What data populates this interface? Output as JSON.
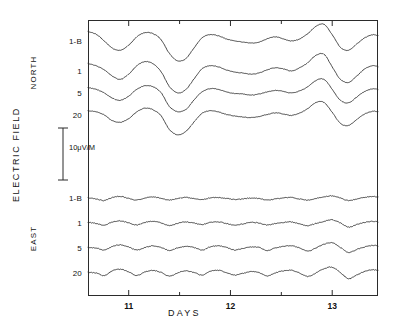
{
  "figure": {
    "background_color": "#ffffff",
    "line_color": "#2b2b2b",
    "width": 394,
    "height": 323
  },
  "axes": {
    "y_title": "ELECTRIC FIELD",
    "x_title": "DAYS",
    "x_ticks": [
      "11",
      "12",
      "13"
    ],
    "frame": {
      "left": 88,
      "top": 20,
      "width": 290,
      "height": 276
    }
  },
  "scale_bar": {
    "label": "10μV/M",
    "value": 10,
    "unit": "μV/M"
  },
  "groups": [
    {
      "name": "NORTH",
      "label": "NORTH"
    },
    {
      "name": "EAST",
      "label": "EAST"
    }
  ],
  "trace_labels": {
    "north": [
      "1-B",
      "1",
      "5",
      "20"
    ],
    "east": [
      "1-B",
      "1",
      "5",
      "20"
    ]
  },
  "chart_data": {
    "type": "line",
    "title": "",
    "subtitle": "",
    "xlabel": "DAYS",
    "ylabel": "ELECTRIC FIELD",
    "xlim": [
      10.6,
      13.45
    ],
    "x_tick_values": [
      11,
      12,
      13
    ],
    "x_minor_tick_values": [
      11.5,
      12.5
    ],
    "grid": false,
    "legend": "none",
    "y_axis_type": "stacked-offset-traces",
    "scale_bar": {
      "label": "10μV/M",
      "value": 10,
      "unit": "μV/M"
    },
    "panels": [
      {
        "name": "NORTH",
        "label": "NORTH",
        "traces": [
          {
            "name": "1-B",
            "label": "1-B",
            "baseline_y": 42,
            "x": [
              10.6,
              10.68,
              10.76,
              10.84,
              10.92,
              11.0,
              11.08,
              11.16,
              11.24,
              11.32,
              11.4,
              11.48,
              11.56,
              11.64,
              11.72,
              11.8,
              11.88,
              11.96,
              12.04,
              12.12,
              12.2,
              12.28,
              12.36,
              12.44,
              12.52,
              12.6,
              12.68,
              12.76,
              12.84,
              12.92,
              13.0,
              13.08,
              13.16,
              13.24,
              13.32,
              13.4,
              13.45
            ],
            "values": [
              2.0,
              1.5,
              0.2,
              -1.2,
              -1.6,
              -0.6,
              1.0,
              1.8,
              1.6,
              0.4,
              -2.2,
              -3.6,
              -3.2,
              -1.2,
              0.8,
              1.4,
              1.2,
              0.6,
              0.2,
              0.0,
              -0.2,
              0.0,
              0.6,
              1.0,
              0.6,
              0.2,
              0.6,
              1.6,
              3.0,
              3.4,
              1.4,
              -1.0,
              -1.6,
              -0.4,
              0.8,
              1.4,
              1.2
            ]
          },
          {
            "name": "1",
            "label": "1",
            "baseline_y": 72,
            "x": [
              10.6,
              10.68,
              10.76,
              10.84,
              10.92,
              11.0,
              11.08,
              11.16,
              11.24,
              11.32,
              11.4,
              11.48,
              11.56,
              11.64,
              11.72,
              11.8,
              11.88,
              11.96,
              12.04,
              12.12,
              12.2,
              12.28,
              12.36,
              12.44,
              12.52,
              12.6,
              12.68,
              12.76,
              12.84,
              12.92,
              13.0,
              13.08,
              13.16,
              13.24,
              13.32,
              13.4,
              13.45
            ],
            "values": [
              1.6,
              1.2,
              0.4,
              -0.8,
              -1.4,
              -0.4,
              1.2,
              2.0,
              1.6,
              0.0,
              -2.8,
              -4.0,
              -3.4,
              -1.4,
              0.6,
              1.2,
              1.0,
              0.4,
              0.0,
              -0.2,
              -0.4,
              -0.2,
              0.4,
              0.8,
              0.6,
              0.2,
              0.8,
              1.8,
              3.2,
              3.4,
              1.0,
              -1.4,
              -2.0,
              -0.8,
              0.6,
              1.2,
              1.0
            ]
          },
          {
            "name": "5",
            "label": "5",
            "baseline_y": 94,
            "x": [
              10.6,
              10.68,
              10.76,
              10.84,
              10.92,
              11.0,
              11.08,
              11.16,
              11.24,
              11.32,
              11.4,
              11.48,
              11.56,
              11.64,
              11.72,
              11.8,
              11.88,
              11.96,
              12.04,
              12.12,
              12.2,
              12.28,
              12.36,
              12.44,
              12.52,
              12.6,
              12.68,
              12.76,
              12.84,
              12.92,
              13.0,
              13.08,
              13.16,
              13.24,
              13.32,
              13.4,
              13.45
            ],
            "values": [
              1.2,
              0.9,
              0.2,
              -0.8,
              -1.2,
              -0.4,
              0.9,
              1.6,
              1.4,
              0.2,
              -2.4,
              -3.4,
              -3.0,
              -1.2,
              0.4,
              1.0,
              0.9,
              0.4,
              0.1,
              0.0,
              -0.2,
              0.0,
              0.4,
              0.7,
              0.5,
              0.2,
              0.6,
              1.4,
              2.6,
              2.8,
              0.9,
              -1.2,
              -1.7,
              -0.6,
              0.5,
              1.0,
              0.9
            ]
          },
          {
            "name": "20",
            "label": "20",
            "baseline_y": 116,
            "x": [
              10.6,
              10.68,
              10.76,
              10.84,
              10.92,
              11.0,
              11.08,
              11.16,
              11.24,
              11.32,
              11.4,
              11.48,
              11.56,
              11.64,
              11.72,
              11.8,
              11.88,
              11.96,
              12.04,
              12.12,
              12.2,
              12.28,
              12.36,
              12.44,
              12.52,
              12.6,
              12.68,
              12.76,
              12.84,
              12.92,
              13.0,
              13.08,
              13.16,
              13.24,
              13.32,
              13.4,
              13.45
            ],
            "values": [
              1.0,
              0.8,
              0.2,
              -0.9,
              -1.2,
              -0.5,
              0.8,
              1.5,
              1.2,
              0.0,
              -2.6,
              -3.6,
              -3.0,
              -1.2,
              0.5,
              1.0,
              0.8,
              0.3,
              0.0,
              -0.2,
              -0.3,
              -0.1,
              0.3,
              0.6,
              0.4,
              0.1,
              0.6,
              1.4,
              2.6,
              2.6,
              0.7,
              -1.4,
              -1.8,
              -0.7,
              0.4,
              0.9,
              0.8
            ]
          }
        ]
      },
      {
        "name": "EAST",
        "label": "EAST",
        "traces": [
          {
            "name": "1-B",
            "label": "1-B",
            "baseline_y": 199,
            "x": [
              10.6,
              10.68,
              10.76,
              10.84,
              10.92,
              11.0,
              11.08,
              11.16,
              11.24,
              11.32,
              11.4,
              11.48,
              11.56,
              11.64,
              11.72,
              11.8,
              11.88,
              11.96,
              12.04,
              12.12,
              12.2,
              12.28,
              12.36,
              12.44,
              12.52,
              12.6,
              12.68,
              12.76,
              12.84,
              12.92,
              13.0,
              13.08,
              13.16,
              13.24,
              13.32,
              13.4,
              13.45
            ],
            "values": [
              0.2,
              0.0,
              -0.3,
              0.3,
              0.5,
              0.1,
              -0.2,
              0.2,
              0.4,
              0.1,
              -0.2,
              0.1,
              0.3,
              0.1,
              -0.1,
              0.2,
              0.3,
              0.1,
              -0.1,
              0.0,
              0.2,
              0.1,
              -0.2,
              0.0,
              0.2,
              0.3,
              0.0,
              -0.2,
              0.1,
              0.4,
              0.6,
              0.2,
              -0.3,
              0.0,
              0.3,
              0.5,
              0.4
            ]
          },
          {
            "name": "1",
            "label": "1",
            "baseline_y": 224,
            "x": [
              10.6,
              10.68,
              10.76,
              10.84,
              10.92,
              11.0,
              11.08,
              11.16,
              11.24,
              11.32,
              11.4,
              11.48,
              11.56,
              11.64,
              11.72,
              11.8,
              11.88,
              11.96,
              12.04,
              12.12,
              12.2,
              12.28,
              12.36,
              12.44,
              12.52,
              12.6,
              12.68,
              12.76,
              12.84,
              12.92,
              13.0,
              13.08,
              13.16,
              13.24,
              13.32,
              13.4,
              13.45
            ],
            "values": [
              0.3,
              0.1,
              -0.2,
              0.4,
              0.6,
              0.2,
              -0.2,
              0.3,
              0.5,
              0.2,
              -0.3,
              0.1,
              0.4,
              0.2,
              -0.1,
              0.3,
              0.4,
              0.1,
              -0.2,
              0.0,
              0.3,
              0.2,
              -0.2,
              0.1,
              0.3,
              0.4,
              0.0,
              -0.3,
              0.1,
              0.5,
              0.8,
              0.2,
              -0.6,
              -0.1,
              0.3,
              0.5,
              0.4
            ]
          },
          {
            "name": "5",
            "label": "5",
            "baseline_y": 249,
            "x": [
              10.6,
              10.68,
              10.76,
              10.84,
              10.92,
              11.0,
              11.08,
              11.16,
              11.24,
              11.32,
              11.4,
              11.48,
              11.56,
              11.64,
              11.72,
              11.8,
              11.88,
              11.96,
              12.04,
              12.12,
              12.2,
              12.28,
              12.36,
              12.44,
              12.52,
              12.6,
              12.68,
              12.76,
              12.84,
              12.92,
              13.0,
              13.08,
              13.16,
              13.24,
              13.32,
              13.4,
              13.45
            ],
            "values": [
              0.3,
              0.2,
              -0.2,
              0.5,
              0.8,
              0.4,
              -0.2,
              0.3,
              0.6,
              0.3,
              -0.3,
              0.2,
              0.5,
              0.3,
              -0.2,
              0.4,
              0.6,
              0.3,
              -0.2,
              0.1,
              0.4,
              0.3,
              -0.3,
              0.2,
              0.5,
              0.6,
              0.2,
              -0.4,
              0.2,
              0.9,
              1.2,
              0.3,
              -0.7,
              -0.1,
              0.4,
              0.7,
              0.6
            ]
          },
          {
            "name": "20",
            "label": "20",
            "baseline_y": 274,
            "x": [
              10.6,
              10.68,
              10.76,
              10.84,
              10.92,
              11.0,
              11.08,
              11.16,
              11.24,
              11.32,
              11.4,
              11.48,
              11.56,
              11.64,
              11.72,
              11.8,
              11.88,
              11.96,
              12.04,
              12.12,
              12.2,
              12.28,
              12.36,
              12.44,
              12.52,
              12.6,
              12.68,
              12.76,
              12.84,
              12.92,
              13.0,
              13.08,
              13.16,
              13.24,
              13.32,
              13.4,
              13.45
            ],
            "values": [
              0.3,
              0.2,
              -0.3,
              0.6,
              0.9,
              0.4,
              -0.3,
              0.4,
              0.7,
              0.3,
              -0.4,
              0.2,
              0.6,
              0.3,
              -0.2,
              0.5,
              0.7,
              0.3,
              -0.2,
              0.1,
              0.5,
              0.3,
              -0.4,
              0.2,
              0.6,
              0.7,
              0.2,
              -0.5,
              0.2,
              1.0,
              1.3,
              0.3,
              -0.9,
              -0.2,
              0.5,
              0.8,
              0.7
            ]
          }
        ]
      }
    ]
  }
}
